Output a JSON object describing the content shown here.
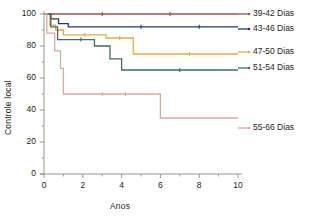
{
  "chart_data": {
    "type": "line",
    "title": "",
    "xlabel": "Anos",
    "ylabel": "Controle local",
    "xlim": [
      0,
      10
    ],
    "ylim": [
      0,
      100
    ],
    "xticks": [
      "0",
      "2",
      "4",
      "6",
      "8",
      "10"
    ],
    "yticks": [
      "0",
      "20",
      "40",
      "60",
      "80",
      "100"
    ],
    "grid": false,
    "legend_position": "right",
    "series": [
      {
        "name": "39-42 Dias",
        "color": "#9d5050",
        "points": [
          [
            0,
            100
          ],
          [
            10,
            100
          ]
        ]
      },
      {
        "name": "43-46 Dias",
        "color": "#1f3b63",
        "points": [
          [
            0,
            100
          ],
          [
            0.35,
            100
          ],
          [
            0.35,
            97
          ],
          [
            0.75,
            97
          ],
          [
            0.75,
            94
          ],
          [
            1.25,
            94
          ],
          [
            1.25,
            92
          ],
          [
            10,
            92
          ]
        ]
      },
      {
        "name": "47-50 Dias",
        "color": "#f0a93c",
        "points": [
          [
            0,
            100
          ],
          [
            0.3,
            100
          ],
          [
            0.3,
            93
          ],
          [
            0.6,
            93
          ],
          [
            0.6,
            90
          ],
          [
            1.0,
            90
          ],
          [
            1.0,
            87
          ],
          [
            3.2,
            87
          ],
          [
            3.2,
            85
          ],
          [
            4.6,
            85
          ],
          [
            4.6,
            75
          ],
          [
            10,
            75
          ]
        ]
      },
      {
        "name": "51-54 Dias",
        "color": "#3e6f65",
        "points": [
          [
            0,
            100
          ],
          [
            0.35,
            100
          ],
          [
            0.35,
            92
          ],
          [
            0.7,
            92
          ],
          [
            0.7,
            84
          ],
          [
            2.6,
            84
          ],
          [
            2.6,
            80
          ],
          [
            3.4,
            80
          ],
          [
            3.4,
            72
          ],
          [
            4.0,
            72
          ],
          [
            4.0,
            65
          ],
          [
            10,
            65
          ]
        ]
      },
      {
        "name": "55-66 Dias",
        "color": "#dba9a1",
        "points": [
          [
            0,
            100
          ],
          [
            0.15,
            100
          ],
          [
            0.15,
            88
          ],
          [
            0.55,
            88
          ],
          [
            0.55,
            77
          ],
          [
            0.85,
            77
          ],
          [
            0.85,
            66
          ],
          [
            1.0,
            66
          ],
          [
            1.0,
            50
          ],
          [
            6.0,
            50
          ],
          [
            6.0,
            35
          ],
          [
            10,
            35
          ]
        ]
      }
    ],
    "legend_entries": [
      {
        "label": "39-42 Dias",
        "color": "#9d5050"
      },
      {
        "label": "43-46 Dias",
        "color": "#1f3b63"
      },
      {
        "label": "47-50 Dias",
        "color": "#f0a93c"
      },
      {
        "label": "51-54 Dias",
        "color": "#3e6f65"
      },
      {
        "label": "55-66 Dias",
        "color": "#dba9a1"
      }
    ]
  },
  "axes": {
    "axis_color": "#8a8a8a",
    "ylabel": "Controle local",
    "xlabel": "Anos"
  }
}
